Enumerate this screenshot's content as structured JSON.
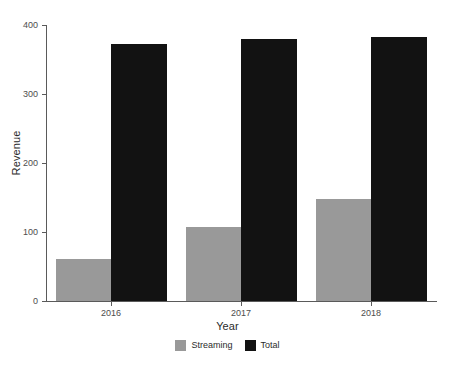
{
  "chart_data": {
    "type": "bar",
    "title": "",
    "categories": [
      "2016",
      "2017",
      "2018"
    ],
    "series": [
      {
        "name": "Streaming",
        "values": [
          61,
          107,
          148
        ],
        "color": "#999999"
      },
      {
        "name": "Total",
        "values": [
          373,
          380,
          382
        ],
        "color": "#121212"
      }
    ],
    "xlabel": "Year",
    "ylabel": "Revenue",
    "ylim": [
      0,
      400
    ],
    "yticks": [
      0,
      100,
      200,
      300,
      400
    ],
    "ytick_labels": [
      "0",
      "100",
      "200",
      "300",
      "400"
    ],
    "xtick_labels": [
      "2016",
      "2017",
      "2018"
    ],
    "grid": false,
    "legend_position": "bottom",
    "legend_entries": [
      "Streaming",
      "Total"
    ],
    "background_color": "#ffffff",
    "axis_color": "#5a5a5a"
  }
}
